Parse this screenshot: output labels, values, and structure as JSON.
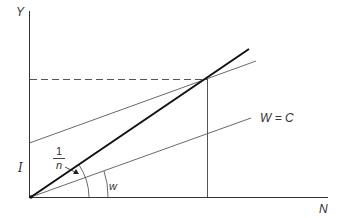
{
  "diagram": {
    "axes": {
      "y_label": "Y",
      "x_label": "N"
    },
    "labels": {
      "intercept": "I",
      "slope_numerator": "1",
      "slope_denominator": "n",
      "wage_angle": "w",
      "line_label": "W = C"
    },
    "colors": {
      "line": "#333333",
      "thick_line": "#111111",
      "background": "#ffffff"
    }
  }
}
